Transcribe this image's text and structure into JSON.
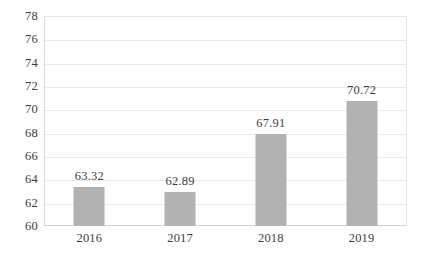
{
  "chart_data": {
    "type": "bar",
    "title": "",
    "subtitle": "",
    "xlabel": "",
    "ylabel": "",
    "categories": [
      "2016",
      "2017",
      "2018",
      "2019"
    ],
    "values": [
      63.32,
      62.89,
      67.91,
      70.72
    ],
    "value_labels": [
      "63.32",
      "62.89",
      "67.91",
      "70.72"
    ],
    "series": [
      {
        "name": "",
        "values": [
          63.32,
          62.89,
          67.91,
          70.72
        ],
        "color": "#b2b2b2"
      }
    ],
    "ylim": [
      60,
      78
    ],
    "y_tick_step": 2,
    "y_ticks": [
      78,
      76,
      74,
      72,
      70,
      68,
      66,
      64,
      62,
      60
    ],
    "y_tick_labels": [
      "78",
      "76",
      "74",
      "72",
      "70",
      "68",
      "66",
      "64",
      "62",
      "60"
    ],
    "grid": true,
    "grid_axis": "y",
    "legend": false,
    "legend_position": "none",
    "data_labels": true,
    "annotations": [],
    "colors": {
      "bar_fill": "#b2b2b2",
      "gridline": "#e9e9e9",
      "axis_line": "#d9d9d9",
      "plot_background": "#ffffff",
      "text": "#3c3c3c",
      "page_background": "#ffffff"
    }
  }
}
